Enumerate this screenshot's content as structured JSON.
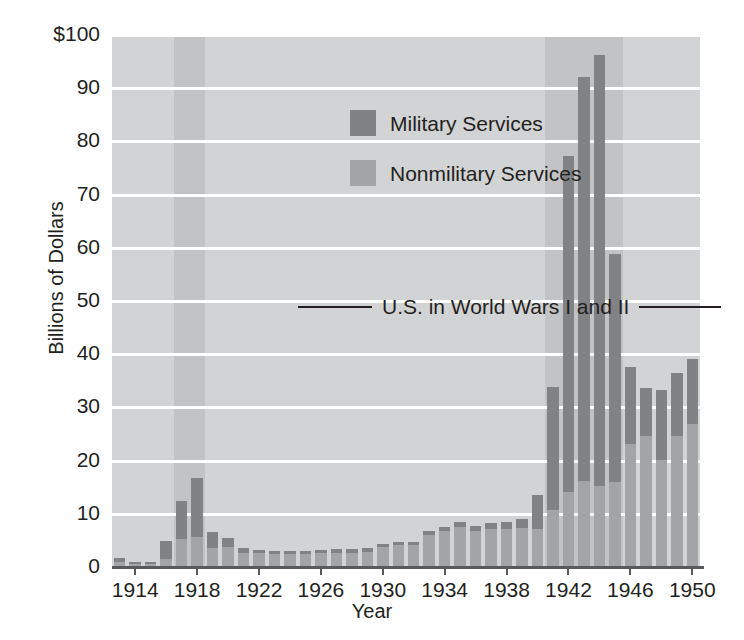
{
  "chart_data": {
    "type": "bar",
    "title": "",
    "subtitle": "",
    "xlabel": "Year",
    "ylabel": "Billions of Dollars",
    "ylim": [
      0,
      100
    ],
    "yticks": [
      0,
      10,
      20,
      30,
      40,
      50,
      60,
      70,
      80,
      90,
      100
    ],
    "ytick_labels": [
      "0",
      "10",
      "20",
      "30",
      "40",
      "50",
      "60",
      "70",
      "80",
      "90",
      "$100"
    ],
    "xticks": [
      1914,
      1918,
      1922,
      1926,
      1930,
      1934,
      1938,
      1942,
      1946,
      1950
    ],
    "xtick_labels": [
      "1914",
      "1918",
      "1922",
      "1926",
      "1930",
      "1934",
      "1938",
      "1942",
      "1946",
      "1950"
    ],
    "grid": true,
    "stacked": true,
    "legend_position": "upper-left-inside",
    "legend": [
      "Military Services",
      "Nonmilitary Services"
    ],
    "series": [
      {
        "name": "Military Services",
        "color": "#808284",
        "values": [
          0.8,
          0.3,
          0.3,
          3.4,
          7.2,
          11.0,
          3.0,
          1.7,
          0.9,
          0.7,
          0.6,
          0.6,
          0.6,
          0.6,
          0.7,
          0.7,
          0.7,
          0.7,
          0.7,
          0.6,
          0.7,
          0.9,
          0.9,
          0.9,
          1.0,
          1.2,
          1.7,
          6.3,
          23.0,
          63.0,
          76.0,
          81.0,
          43.0,
          14.5,
          9.1,
          13.0,
          11.9,
          12.3
        ]
      },
      {
        "name": "Nonmilitary Services",
        "color": "#a3a4a6",
        "values": [
          0.7,
          0.4,
          0.4,
          1.3,
          5.0,
          5.5,
          3.4,
          3.6,
          2.4,
          2.4,
          2.3,
          2.3,
          2.3,
          2.5,
          2.5,
          2.5,
          2.7,
          3.5,
          3.9,
          4.0,
          5.8,
          6.5,
          7.4,
          6.6,
          7.0,
          7.0,
          7.1,
          7.0,
          10.6,
          14.0,
          16.0,
          15.0,
          15.7,
          23.0,
          24.4,
          20.0,
          24.4,
          26.7
        ]
      }
    ],
    "years": [
      1913,
      1914,
      1915,
      1916,
      1917,
      1918,
      1919,
      1920,
      1921,
      1922,
      1923,
      1924,
      1925,
      1926,
      1927,
      1928,
      1929,
      1930,
      1931,
      1932,
      1933,
      1934,
      1935,
      1936,
      1937,
      1938,
      1939,
      1940,
      1941,
      1942,
      1943,
      1944,
      1945,
      1946,
      1947,
      1948,
      1949,
      1950
    ],
    "totals": [
      1.5,
      0.7,
      0.7,
      4.7,
      12.2,
      16.5,
      6.4,
      5.3,
      3.3,
      3.1,
      2.9,
      2.9,
      2.9,
      3.1,
      3.2,
      3.2,
      3.4,
      4.2,
      4.6,
      4.6,
      6.5,
      7.4,
      8.3,
      7.5,
      8.0,
      8.2,
      8.8,
      13.3,
      33.6,
      77.0,
      92.0,
      96.0,
      58.7,
      37.5,
      33.5,
      33.0,
      36.3,
      39.0
    ],
    "annotations": [
      {
        "text": "U.S. in World Wars I and II",
        "type": "label-with-leaders"
      }
    ],
    "shaded_bands": [
      {
        "label": "World War I",
        "start_year": 1917,
        "end_year": 1918,
        "color": "#c2c3c4"
      },
      {
        "label": "World War II",
        "start_year": 1941,
        "end_year": 1945,
        "color": "#c2c3c4"
      }
    ],
    "plot_background": "#d2d3d4",
    "gridline_color": "#ffffff",
    "axis_color": "#58595b"
  },
  "legend": {
    "military_label": "Military Services",
    "nonmilitary_label": "Nonmilitary Services"
  },
  "annotation": {
    "war_label": "U.S. in World Wars I and II"
  },
  "axes": {
    "y_title": "Billions of Dollars",
    "x_title": "Year"
  }
}
